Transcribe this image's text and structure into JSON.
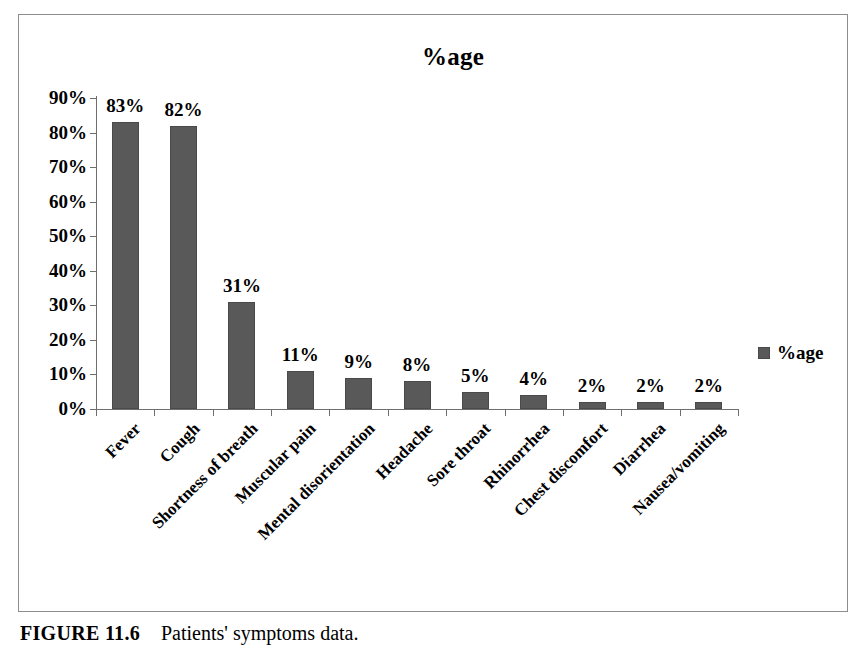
{
  "chart_data": {
    "type": "bar",
    "title": "%age",
    "xlabel": "",
    "ylabel": "",
    "ylim": [
      0,
      90
    ],
    "grid": false,
    "legend_position": "right",
    "legend_entries": [
      "%age"
    ],
    "categories": [
      "Fever",
      "Cough",
      "Shortness of breath",
      "Muscular pain",
      "Mental disorientation",
      "Headache",
      "Sore throat",
      "Rhinorrhea",
      "Chest discomfort",
      "Diarrhea",
      "Nausea/vomiting"
    ],
    "values": [
      83,
      82,
      31,
      11,
      9,
      8,
      5,
      4,
      2,
      2,
      2
    ],
    "value_labels": [
      "83%",
      "82%",
      "31%",
      "11%",
      "9%",
      "8%",
      "5%",
      "4%",
      "2%",
      "2%",
      "2%"
    ],
    "y_ticks": [
      0,
      10,
      20,
      30,
      40,
      50,
      60,
      70,
      80,
      90
    ],
    "y_tick_labels": [
      "0%",
      "10%",
      "20%",
      "30%",
      "40%",
      "50%",
      "60%",
      "70%",
      "80%",
      "90%"
    ],
    "series": [
      {
        "name": "%age",
        "values": [
          83,
          82,
          31,
          11,
          9,
          8,
          5,
          4,
          2,
          2,
          2
        ],
        "color": "#595959"
      }
    ]
  },
  "legend": {
    "label": "%age",
    "swatch_color": "#595959"
  },
  "caption": {
    "figure_number": "FIGURE 11.6",
    "text": "Patients' symptoms data."
  },
  "colors": {
    "bar": "#595959",
    "axis": "#6f6f6f",
    "frame": "#8d8d8d",
    "text": "#000000"
  }
}
